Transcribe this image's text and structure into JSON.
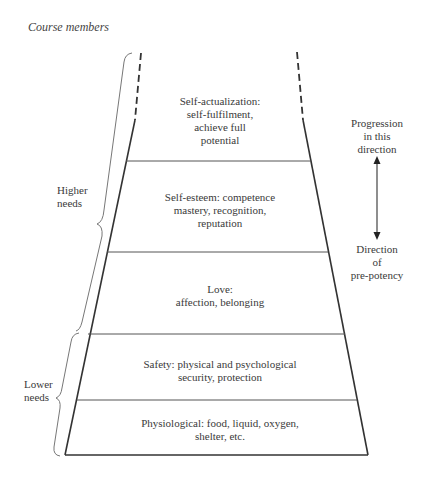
{
  "caption": "Course members",
  "levels": [
    {
      "id": "self-actualization",
      "label": "Self-actualization:\nself-fulfilment,\nachieve full\npotential"
    },
    {
      "id": "self-esteem",
      "label": "Self-esteem: competence\nmastery, recognition,\nreputation"
    },
    {
      "id": "love",
      "label": "Love:\naffection, belonging"
    },
    {
      "id": "safety",
      "label": "Safety: physical and psychological\nsecurity, protection"
    },
    {
      "id": "physiological",
      "label": "Physiological: food, liquid, oxygen,\nshelter, etc."
    }
  ],
  "braces": {
    "higher": "Higher\nneeds",
    "lower": "Lower\nneeds"
  },
  "arrow": {
    "top_label": "Progression\nin this\ndirection",
    "bottom_label": "Direction\nof\npre-potency"
  }
}
